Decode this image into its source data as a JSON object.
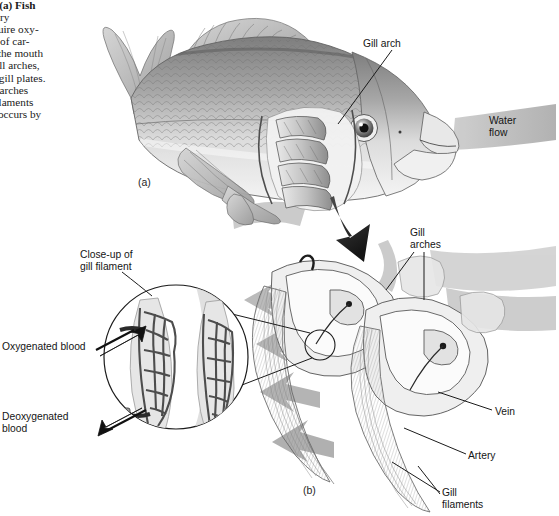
{
  "figure": {
    "caption_lines": [
      "Gills (a) Fish",
      "piratory",
      "o acquire oxy-",
      "et rid of car-",
      "aters the mouth",
      " the gill arches,",
      "y the gill plates.",
      "e gill arches",
      "gill filaments",
      "ange occurs by"
    ],
    "caption_bold_word": "Gills"
  },
  "panels": [
    {
      "name": "panel-a",
      "label": "(a)",
      "x": 138,
      "y": 176
    },
    {
      "name": "panel-b",
      "label": "(b)",
      "x": 303,
      "y": 484
    }
  ],
  "labels": [
    {
      "name": "gill-arch-label",
      "text": "Gill arch",
      "x": 363,
      "y": 38
    },
    {
      "name": "water-flow-label",
      "text": "Water\nflow",
      "x": 489,
      "y": 115
    },
    {
      "name": "close-up-label",
      "text": "Close-up of\ngill filament",
      "x": 80,
      "y": 249
    },
    {
      "name": "gill-arches-label",
      "text": "Gill\narches",
      "x": 410,
      "y": 227
    },
    {
      "name": "oxygenated-blood-label",
      "text": "Oxygenated blood",
      "x": 2,
      "y": 341
    },
    {
      "name": "deoxygenated-blood-label",
      "text": "Deoxygenated\nblood",
      "x": 2,
      "y": 411
    },
    {
      "name": "vein-label",
      "text": "Vein",
      "x": 495,
      "y": 406
    },
    {
      "name": "artery-label",
      "text": "Artery",
      "x": 468,
      "y": 450
    },
    {
      "name": "gill-filaments-label",
      "text": "Gill\nfilaments",
      "x": 442,
      "y": 487
    }
  ],
  "colors": {
    "ink": "#151515",
    "leader_line": "#1b1b1b",
    "arrow_gray": "#b4b4b4",
    "arrow_gray_dark": "#9a9a9a",
    "fish_body": "#cfcfcf",
    "fish_dark": "#8f8f8f",
    "capillary": "#4a4a4a",
    "paper": "#ffffff"
  },
  "illustration": {
    "subject": "fish-gill-anatomy",
    "parts": [
      "fish-body",
      "dorsal-fin",
      "tail-fin",
      "pectoral-fin",
      "pelvic-fin",
      "eye",
      "open-mouth",
      "gill-arch-cutaway",
      "water-flow-arrows",
      "transition-arrow",
      "gill-arch-closeup",
      "gill-filament-circle",
      "capillary-network",
      "vein-vessel",
      "artery-vessel"
    ]
  }
}
